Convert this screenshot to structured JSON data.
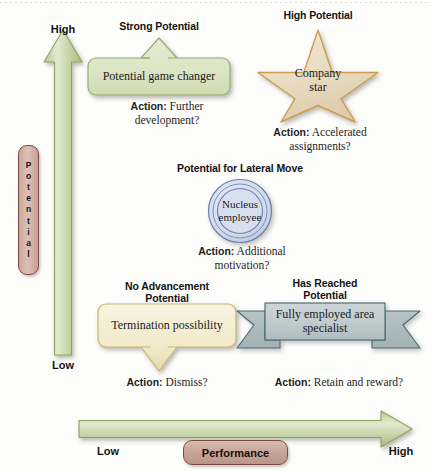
{
  "diagram": {
    "axes": {
      "vertical": {
        "name": "Potential",
        "name_letters": [
          "P",
          "o",
          "t",
          "e",
          "n",
          "t",
          "i",
          "a",
          "l"
        ],
        "high_label": "High",
        "low_label": "Low",
        "color": "#a9bd7e"
      },
      "horizontal": {
        "name": "Performance",
        "high_label": "High",
        "low_label": "Low",
        "color": "#a9bd7e"
      }
    },
    "quadrants": [
      {
        "id": "strong-potential",
        "heading": "Strong Potential",
        "shape": "up-arrow-box",
        "shape_label": "Potential game changer",
        "action_prefix": "Action:",
        "action_text": " Further\ndevelopment?",
        "fill": "#dde5c6",
        "stroke": "#9aab72"
      },
      {
        "id": "high-potential",
        "heading": "High Potential",
        "shape": "star",
        "shape_label": "Company\nstar",
        "action_prefix": "Action:",
        "action_text": " Accelerated\nassignments?",
        "fill": "#ecdfc8",
        "stroke": "#d09a4e"
      },
      {
        "id": "lateral-move",
        "heading": "Potential for Lateral Move",
        "shape": "concentric-circles",
        "shape_label": "Nucleus\nemployee",
        "action_prefix": "Action:",
        "action_text": " Additional\nmotivation?",
        "fill": "#ced7ea",
        "stroke": "#6d7ead"
      },
      {
        "id": "no-advancement",
        "heading": "No Advancement\nPotential",
        "shape": "down-arrow-box",
        "shape_label": "Termination possibility",
        "action_prefix": "Action:",
        "action_text": " Dismiss?",
        "fill": "#f3eccd",
        "stroke": "#c9b472"
      },
      {
        "id": "has-reached-potential",
        "heading": "Has Reached\nPotential",
        "shape": "ribbon-banner",
        "shape_label": "Fully employed area\nspecialist",
        "action_prefix": "Action:",
        "action_text": " Retain and reward?",
        "fill": "#c3cdd0",
        "stroke": "#4d6b73"
      }
    ]
  }
}
